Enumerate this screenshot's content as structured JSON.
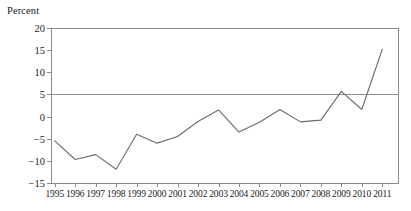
{
  "chart_data": {
    "type": "line",
    "title": "",
    "subtitle": "",
    "xlabel": "",
    "ylabel": "Percent",
    "ylim": [
      -15,
      20
    ],
    "yticks": [
      20,
      15,
      10,
      5,
      0,
      -5,
      -10,
      -15
    ],
    "ytick_labels": [
      "20",
      "15",
      "10",
      "5",
      "0",
      "−5",
      "−10",
      "−15"
    ],
    "categories": [
      "1995",
      "1996",
      "1997",
      "1998",
      "1999",
      "2000",
      "2001",
      "2002",
      "2003",
      "2004",
      "2005",
      "2006",
      "2007",
      "2008",
      "2009",
      "2010",
      "2011"
    ],
    "values": [
      -5.5,
      -9.7,
      -8.6,
      -11.9,
      -4.0,
      -6.0,
      -4.5,
      -1.1,
      1.5,
      -3.5,
      -1.3,
      1.6,
      -1.2,
      -0.8,
      5.7,
      1.6,
      15.2
    ],
    "series": [
      {
        "name": "Percent",
        "values": [
          -5.5,
          -9.7,
          -8.6,
          -11.9,
          -4.0,
          -6.0,
          -4.5,
          -1.1,
          1.5,
          -3.5,
          -1.3,
          1.6,
          -1.2,
          -0.8,
          5.7,
          1.6,
          15.2
        ]
      }
    ],
    "grid": false,
    "legend": "none",
    "zero_line": true,
    "line_color": "#6b6b6b",
    "axis_color": "#8a8a8a"
  }
}
